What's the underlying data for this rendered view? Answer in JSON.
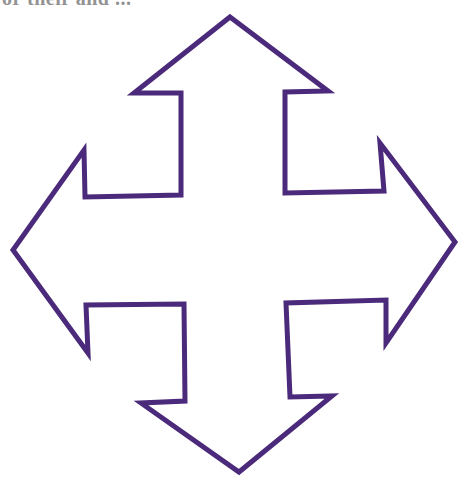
{
  "caption": {
    "text": "or their and ..."
  },
  "figure": {
    "icon": "four-way-arrow-icon",
    "stroke_color": "#4b2a7b",
    "fill_color": "#ffffff",
    "stroke_width": 5,
    "points": "230,17 328,91 285,92 285,193 384,191 380,143 455,242 386,343 386,300 286,303 290,397 332,396 239,472 141,403 185,401 184,304 86,305 88,353 13,250 84,150 85,197 181,195 181,93 134,93"
  }
}
